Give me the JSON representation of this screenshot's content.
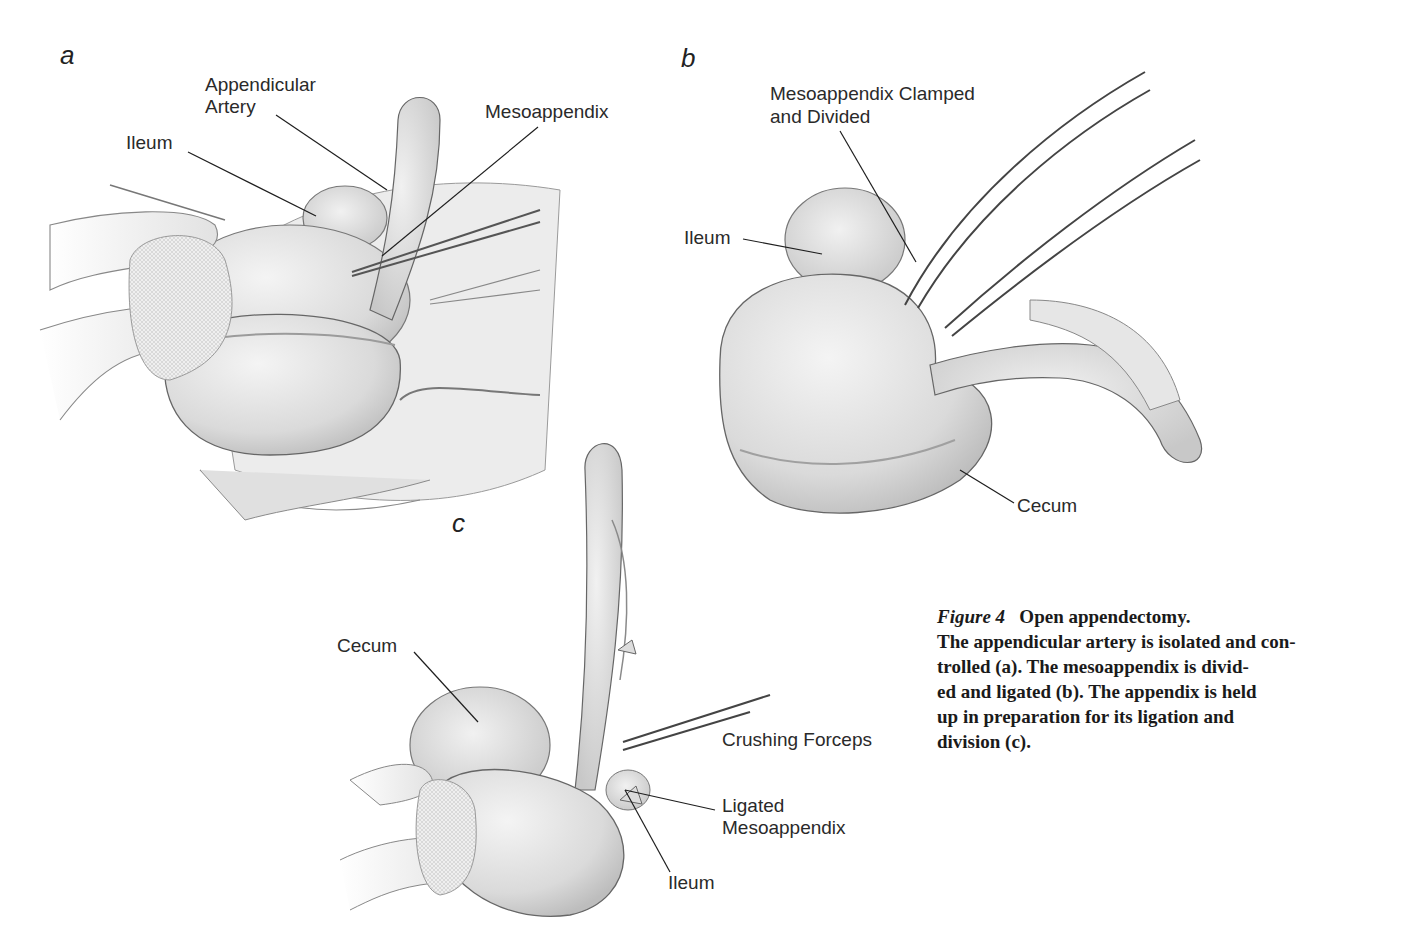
{
  "figure": {
    "number_label": "Figure 4",
    "caption_title": "Open appendectomy.",
    "caption_lines": [
      "The appendicular artery is isolated and con-",
      "trolled (a). The mesoappendix is divid-",
      "ed and ligated (b). The appendix is held",
      "up in preparation for its ligation and",
      "division (c)."
    ],
    "caption_full": "The appendicular artery is isolated and controlled (a). The mesoappendix is divided and ligated (b). The appendix is held up in preparation for its ligation and division (c)."
  },
  "panels": {
    "a": {
      "letter": "a",
      "labels": {
        "appendicular_artery_1": "Appendicular",
        "appendicular_artery_2": "Artery",
        "ileum": "Ileum",
        "mesoappendix": "Mesoappendix"
      }
    },
    "b": {
      "letter": "b",
      "labels": {
        "mesoappendix_clamped_1": "Mesoappendix Clamped",
        "mesoappendix_clamped_2": "and Divided",
        "ileum": "Ileum",
        "cecum": "Cecum"
      }
    },
    "c": {
      "letter": "c",
      "labels": {
        "cecum": "Cecum",
        "crushing_forceps": "Crushing Forceps",
        "ligated_mesoappendix_1": "Ligated",
        "ligated_mesoappendix_2": "Mesoappendix",
        "ileum": "Ileum"
      }
    }
  },
  "colors": {
    "tissue_fill": "#e4e4e4",
    "tissue_shade": "#cfcfcf",
    "outline": "#6e6e6e",
    "leader_line": "#1e1e1e",
    "text": "#2a2a2a"
  }
}
